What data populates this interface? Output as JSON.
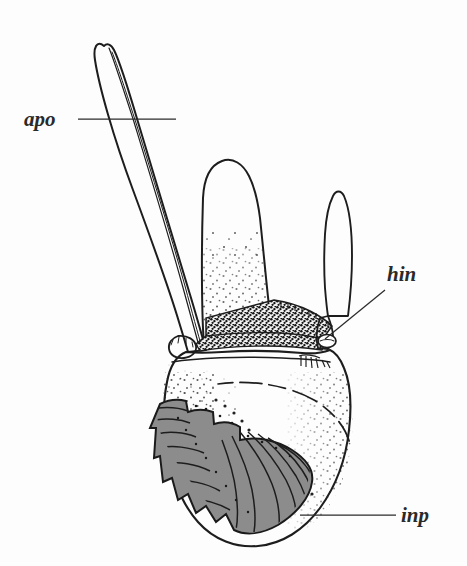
{
  "figure": {
    "domain": "scientific-line-drawing",
    "background_color": "#fdfdfd",
    "ink_color": "#1d1d1d",
    "shade_color": "#8c8c8c",
    "dark_stipple_color": "#141414",
    "width": 467,
    "height": 566
  },
  "labels": [
    {
      "id": "apo",
      "text": "apo",
      "meaning": "apodeme",
      "text_x": 24,
      "text_y": 126,
      "leader": {
        "x1": 78,
        "y1": 119,
        "x2": 176,
        "y2": 119
      }
    },
    {
      "id": "hin",
      "text": "hin",
      "meaning": "hinge",
      "text_x": 387,
      "text_y": 281,
      "leader": {
        "x1": 385,
        "y1": 290,
        "x2": 325,
        "y2": 339
      }
    },
    {
      "id": "inp",
      "text": "inp",
      "meaning": "incisor process",
      "text_x": 401,
      "text_y": 522,
      "leader": {
        "x1": 396,
        "y1": 515,
        "x2": 300,
        "y2": 515
      }
    }
  ],
  "parts": [
    {
      "id": "apodeme",
      "name": "apodeme blade",
      "shaded": false
    },
    {
      "id": "central-lobe",
      "name": "central lobe",
      "shaded": false
    },
    {
      "id": "right-lobe",
      "name": "slender right lobe",
      "shaded": false
    },
    {
      "id": "body",
      "name": "mandible body",
      "shaded": false
    },
    {
      "id": "incisor-process",
      "name": "incisor process",
      "shaded": true
    },
    {
      "id": "dark-band",
      "name": "dark stippled band",
      "shaded": true
    },
    {
      "id": "hinge-condyle",
      "name": "hinge condyle",
      "shaded": false
    },
    {
      "id": "setae-tuft",
      "name": "setae tuft",
      "shaded": false
    }
  ]
}
